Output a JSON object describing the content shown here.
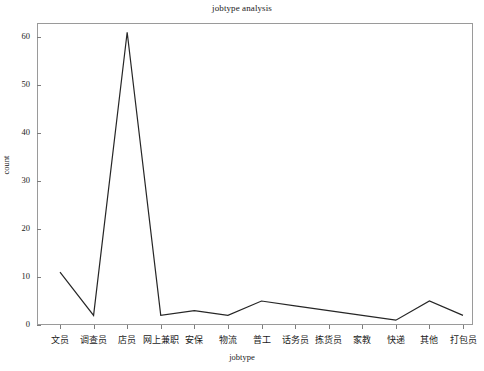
{
  "chart_data": {
    "type": "line",
    "title": "jobtype analysis",
    "xlabel": "jobtype",
    "ylabel": "count",
    "categories": [
      "文员",
      "调查员",
      "店员",
      "网上兼职",
      "安保",
      "物流",
      "普工",
      "话务员",
      "拣货员",
      "家教",
      "快递",
      "其他",
      "打包员"
    ],
    "values": [
      11,
      2,
      61,
      2,
      3,
      2,
      5,
      4,
      3,
      2,
      1,
      5,
      2
    ],
    "ytick_labels": [
      "0",
      "10",
      "20",
      "30",
      "40",
      "50",
      "60"
    ],
    "ytick_values": [
      0,
      10,
      20,
      30,
      40,
      50,
      60
    ],
    "ylim": [
      -1.8,
      64
    ],
    "grid": false,
    "legend": false,
    "line_color": "#262626",
    "line_width": 1.2
  },
  "figure": {
    "background": "#ffffff",
    "frame_color": "#9a9a9a"
  }
}
